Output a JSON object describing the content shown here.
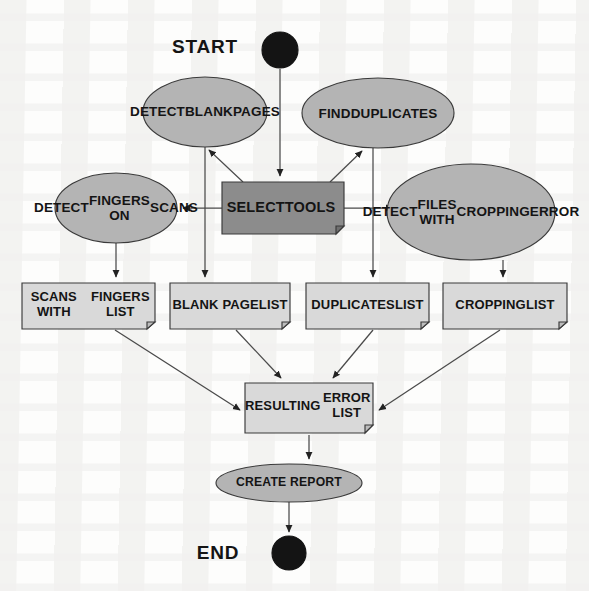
{
  "diagram": {
    "type": "flowchart",
    "canvas": {
      "width": 589,
      "height": 591
    },
    "colors": {
      "background": "#fdfdfc",
      "ellipse_fill": "#b4b4b4",
      "process_fill": "#8c8c8c",
      "document_fill": "#d9d9d9",
      "terminal_fill": "#1a1a1a",
      "stroke": "#3a3a3a",
      "text": "#141414"
    },
    "labels": {
      "start": "START",
      "end": "END"
    },
    "nodes": {
      "start_terminal": {
        "label": "START",
        "shape": "filled-circle",
        "cx": 280,
        "cy": 50,
        "r": 18
      },
      "detect_blank_pages": {
        "label": "DETECT\nBLANK\nPAGES",
        "lines": [
          "DETECT",
          "BLANK",
          "PAGES"
        ],
        "shape": "ellipse",
        "cx": 205,
        "cy": 112,
        "rx": 62,
        "ry": 35
      },
      "find_duplicates": {
        "label": "FIND\nDUPLICATES",
        "lines": [
          "FIND",
          "DUPLICATES"
        ],
        "shape": "ellipse",
        "cx": 378,
        "cy": 113,
        "rx": 76,
        "ry": 35
      },
      "detect_fingers_on_scans": {
        "label": "DETECT\nFINGERS ON\nSCANS",
        "lines": [
          "DETECT",
          "FINGERS ON",
          "SCANS"
        ],
        "shape": "ellipse",
        "cx": 116,
        "cy": 208,
        "rx": 61,
        "ry": 35
      },
      "select_tools": {
        "label": "SELECT\nTOOLS",
        "lines": [
          "SELECT",
          "TOOLS"
        ],
        "shape": "process-document",
        "x": 222,
        "y": 182,
        "width": 122,
        "height": 52
      },
      "detect_files_with_cropping_error": {
        "label": "DETECT\nFILES WITH\nCROPPING\nERROR",
        "lines": [
          "DETECT",
          "FILES WITH",
          "CROPPING",
          "ERROR"
        ],
        "shape": "ellipse",
        "cx": 471,
        "cy": 212,
        "rx": 84,
        "ry": 48
      },
      "scans_with_fingers_list": {
        "label": "SCANS WITH\nFINGERS LIST",
        "lines": [
          "SCANS WITH",
          "FINGERS LIST"
        ],
        "shape": "document",
        "x": 22,
        "y": 283,
        "width": 133,
        "height": 46
      },
      "blank_page_list": {
        "label": "BLANK PAGE\nLIST",
        "lines": [
          "BLANK PAGE",
          "LIST"
        ],
        "shape": "document",
        "x": 170,
        "y": 283,
        "width": 120,
        "height": 46
      },
      "duplicates_list": {
        "label": "DUPLICATES\nLIST",
        "lines": [
          "DUPLICATES",
          "LIST"
        ],
        "shape": "document",
        "x": 306,
        "y": 283,
        "width": 123,
        "height": 46
      },
      "cropping_list": {
        "label": "CROPPING\nLIST",
        "lines": [
          "CROPPING",
          "LIST"
        ],
        "shape": "document",
        "x": 443,
        "y": 283,
        "width": 124,
        "height": 46
      },
      "resulting_error_list": {
        "label": "RESULTING\nERROR LIST",
        "lines": [
          "RESULTING",
          "ERROR LIST"
        ],
        "shape": "document",
        "x": 245,
        "y": 383,
        "width": 128,
        "height": 50
      },
      "create_report": {
        "label": "CREATE REPORT",
        "lines": [
          "CREATE REPORT"
        ],
        "shape": "ellipse",
        "cx": 289,
        "cy": 483,
        "rx": 73,
        "ry": 19
      },
      "end_terminal": {
        "label": "END",
        "shape": "filled-circle",
        "cx": 289,
        "cy": 553,
        "r": 17
      }
    },
    "edges": [
      {
        "from": "start_terminal",
        "to": "select_tools",
        "style": "straight"
      },
      {
        "from": "select_tools",
        "to": "detect_blank_pages",
        "style": "diagonal"
      },
      {
        "from": "select_tools",
        "to": "find_duplicates",
        "style": "diagonal"
      },
      {
        "from": "select_tools",
        "to": "detect_fingers_on_scans",
        "style": "horizontal"
      },
      {
        "from": "select_tools",
        "to": "detect_files_with_cropping_error",
        "style": "horizontal"
      },
      {
        "from": "detect_fingers_on_scans",
        "to": "scans_with_fingers_list",
        "style": "straight"
      },
      {
        "from": "detect_blank_pages",
        "to": "blank_page_list",
        "style": "straight"
      },
      {
        "from": "find_duplicates",
        "to": "duplicates_list",
        "style": "straight"
      },
      {
        "from": "detect_files_with_cropping_error",
        "to": "cropping_list",
        "style": "straight"
      },
      {
        "from": "scans_with_fingers_list",
        "to": "resulting_error_list",
        "style": "diagonal"
      },
      {
        "from": "blank_page_list",
        "to": "resulting_error_list",
        "style": "diagonal"
      },
      {
        "from": "duplicates_list",
        "to": "resulting_error_list",
        "style": "diagonal"
      },
      {
        "from": "cropping_list",
        "to": "resulting_error_list",
        "style": "diagonal"
      },
      {
        "from": "resulting_error_list",
        "to": "create_report",
        "style": "straight"
      },
      {
        "from": "create_report",
        "to": "end_terminal",
        "style": "straight"
      }
    ]
  }
}
